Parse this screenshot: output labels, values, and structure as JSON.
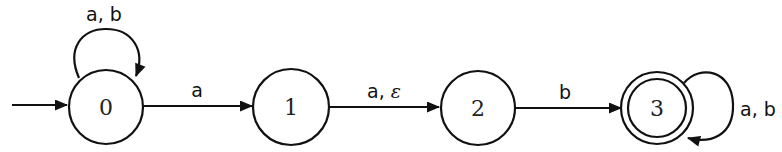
{
  "diagram": {
    "type": "nfa-state-diagram",
    "colors": {
      "stroke": "#111111",
      "background": "#ffffff",
      "text": "#222222"
    },
    "states": [
      {
        "id": "0",
        "label": "0",
        "initial": true,
        "accepting": false
      },
      {
        "id": "1",
        "label": "1",
        "initial": false,
        "accepting": false
      },
      {
        "id": "2",
        "label": "2",
        "initial": false,
        "accepting": false
      },
      {
        "id": "3",
        "label": "3",
        "initial": false,
        "accepting": true
      }
    ],
    "transitions": [
      {
        "from": "0",
        "to": "0",
        "label": "a, b"
      },
      {
        "from": "0",
        "to": "1",
        "label": "a"
      },
      {
        "from": "1",
        "to": "2",
        "label_prefix": "a, ",
        "label_symbol": "ε",
        "label": "a, ε"
      },
      {
        "from": "2",
        "to": "3",
        "label": "b"
      },
      {
        "from": "3",
        "to": "3",
        "label": "a, b"
      }
    ]
  }
}
